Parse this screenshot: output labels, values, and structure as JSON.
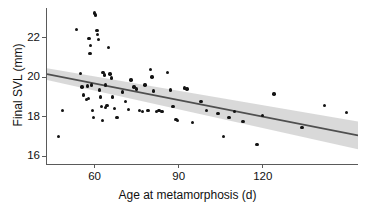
{
  "chart_data": {
    "type": "scatter",
    "title": "",
    "xlabel": "Age at metamorphosis (d)",
    "ylabel": "Final SVL (mm)",
    "xlim": [
      43,
      154
    ],
    "ylim": [
      15.6,
      23.6
    ],
    "xticks": [
      60,
      90,
      120
    ],
    "xtick_labels": [
      "60",
      "90",
      "120"
    ],
    "yticks": [
      16,
      18,
      20,
      22
    ],
    "ytick_labels": [
      "16",
      "18",
      "20",
      "22"
    ],
    "grid": false,
    "legend": "none",
    "point_color": "#131313",
    "line_color": "#4d4d4d",
    "band_color": "#d4d4d4",
    "axis_color": "#5a5a5a",
    "points": [
      [
        47.0,
        17.0
      ],
      [
        48.5,
        18.3
      ],
      [
        53.5,
        22.4
      ],
      [
        55.0,
        20.2
      ],
      [
        55.5,
        19.5
      ],
      [
        56.0,
        19.1
      ],
      [
        57.0,
        18.85
      ],
      [
        57.5,
        19.55
      ],
      [
        57.8,
        18.9
      ],
      [
        58.0,
        21.95
      ],
      [
        58.3,
        21.2
      ],
      [
        58.6,
        21.6
      ],
      [
        59.0,
        19.6
      ],
      [
        59.3,
        18.3
      ],
      [
        59.6,
        17.95
      ],
      [
        60.0,
        23.25
      ],
      [
        60.4,
        23.15
      ],
      [
        60.8,
        22.35
      ],
      [
        61.0,
        22.15
      ],
      [
        61.4,
        21.9
      ],
      [
        61.8,
        19.35
      ],
      [
        62.0,
        19.0
      ],
      [
        62.4,
        18.5
      ],
      [
        62.8,
        17.8
      ],
      [
        63.0,
        20.25
      ],
      [
        63.4,
        20.1
      ],
      [
        63.8,
        19.6
      ],
      [
        64.0,
        18.45
      ],
      [
        64.4,
        18.55
      ],
      [
        65.0,
        21.5
      ],
      [
        65.5,
        20.15
      ],
      [
        66.0,
        19.95
      ],
      [
        66.5,
        19.0
      ],
      [
        67.0,
        18.4
      ],
      [
        68.0,
        17.95
      ],
      [
        70.0,
        19.25
      ],
      [
        71.0,
        18.75
      ],
      [
        72.0,
        18.35
      ],
      [
        73.0,
        19.85
      ],
      [
        74.0,
        19.5
      ],
      [
        75.0,
        19.4
      ],
      [
        76.0,
        18.3
      ],
      [
        77.0,
        18.25
      ],
      [
        78.0,
        19.6
      ],
      [
        79.0,
        18.3
      ],
      [
        80.0,
        20.4
      ],
      [
        80.5,
        20.0
      ],
      [
        81.0,
        19.3
      ],
      [
        82.0,
        18.25
      ],
      [
        83.0,
        18.3
      ],
      [
        84.0,
        18.25
      ],
      [
        86.0,
        20.25
      ],
      [
        87.0,
        19.35
      ],
      [
        88.0,
        18.5
      ],
      [
        89.0,
        17.85
      ],
      [
        89.5,
        17.8
      ],
      [
        92.0,
        19.45
      ],
      [
        93.0,
        19.4
      ],
      [
        95.0,
        17.7
      ],
      [
        98.0,
        18.75
      ],
      [
        100.0,
        18.3
      ],
      [
        104.0,
        18.15
      ],
      [
        106.0,
        17.0
      ],
      [
        108.0,
        17.95
      ],
      [
        110.0,
        18.25
      ],
      [
        113.0,
        17.75
      ],
      [
        118.0,
        16.6
      ],
      [
        120.0,
        18.05
      ],
      [
        124.0,
        19.15
      ],
      [
        134.0,
        17.45
      ],
      [
        142.0,
        18.55
      ],
      [
        150.0,
        18.2
      ]
    ],
    "fit_line": {
      "x_start": 43.0,
      "y_start": 20.15,
      "x_end": 154.0,
      "y_end": 17.05,
      "ci_upper_start": 20.45,
      "ci_lower_start": 19.85,
      "ci_upper_end": 17.75,
      "ci_lower_end": 16.35
    }
  }
}
